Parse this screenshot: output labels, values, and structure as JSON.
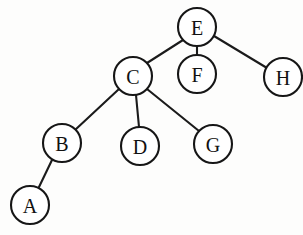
{
  "diagram": {
    "type": "tree-graph",
    "canvas": {
      "width": 303,
      "height": 235,
      "background": "#fdfdfc"
    },
    "style": {
      "node_fill": "#ffffff",
      "node_stroke": "#161616",
      "node_radius": 19,
      "edge_stroke": "#1b1b1b",
      "edge_width": 2.1,
      "label_color": "#111111"
    },
    "nodes": [
      {
        "id": "E",
        "label": "E",
        "cx": 197,
        "cy": 27,
        "r": 19
      },
      {
        "id": "F",
        "label": "F",
        "cx": 197,
        "cy": 74,
        "r": 19
      },
      {
        "id": "H",
        "label": "H",
        "cx": 283,
        "cy": 77,
        "r": 19
      },
      {
        "id": "C",
        "label": "C",
        "cx": 133,
        "cy": 76,
        "r": 19
      },
      {
        "id": "B",
        "label": "B",
        "cx": 62,
        "cy": 143,
        "r": 19
      },
      {
        "id": "D",
        "label": "D",
        "cx": 140,
        "cy": 146,
        "r": 19
      },
      {
        "id": "G",
        "label": "G",
        "cx": 213,
        "cy": 144,
        "r": 19
      },
      {
        "id": "A",
        "label": "A",
        "cx": 30,
        "cy": 205,
        "r": 19
      }
    ],
    "edges": [
      {
        "from": "E",
        "to": "C",
        "x1": 183,
        "y1": 40,
        "x2": 147,
        "y2": 63
      },
      {
        "from": "E",
        "to": "F",
        "x1": 197,
        "y1": 46,
        "x2": 197,
        "y2": 55
      },
      {
        "from": "E",
        "to": "H",
        "x1": 214,
        "y1": 36,
        "x2": 267,
        "y2": 68
      },
      {
        "from": "C",
        "to": "B",
        "x1": 119,
        "y1": 89,
        "x2": 75,
        "y2": 130
      },
      {
        "from": "C",
        "to": "D",
        "x1": 136,
        "y1": 95,
        "x2": 139,
        "y2": 127
      },
      {
        "from": "C",
        "to": "G",
        "x1": 147,
        "y1": 89,
        "x2": 199,
        "y2": 131
      },
      {
        "from": "B",
        "to": "A",
        "x1": 52,
        "y1": 160,
        "x2": 39,
        "y2": 187
      }
    ]
  }
}
